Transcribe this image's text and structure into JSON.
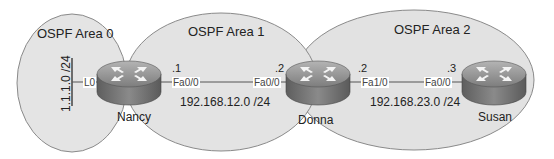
{
  "diagram": {
    "areas": [
      {
        "id": "area0",
        "label": "OSPF Area 0"
      },
      {
        "id": "area1",
        "label": "OSPF Area 1"
      },
      {
        "id": "area2",
        "label": "OSPF Area 2"
      }
    ],
    "routers": [
      {
        "name": "Nancy",
        "icon": "router-icon"
      },
      {
        "name": "Donna",
        "icon": "router-icon"
      },
      {
        "name": "Susan",
        "icon": "router-icon"
      }
    ],
    "loopback": {
      "interface": "L0",
      "network": "1.1.1.0 /24"
    },
    "links": [
      {
        "subnet": "192.168.12.0 /24",
        "a": {
          "router": "Nancy",
          "interface": "Fa0/0",
          "host": ".1"
        },
        "b": {
          "router": "Donna",
          "interface": "Fa0/0",
          "host": ".2"
        }
      },
      {
        "subnet": "192.168.23.0 /24",
        "a": {
          "router": "Donna",
          "interface": "Fa1/0",
          "host": ".2"
        },
        "b": {
          "router": "Susan",
          "interface": "Fa0/0",
          "host": ".3"
        }
      }
    ],
    "colors": {
      "area_fill": "#e3e3e3",
      "area_stroke": "#8a8a8a",
      "router_top": "#9a9a9a",
      "router_side": "#6e6e6e",
      "link": "#555555"
    }
  }
}
